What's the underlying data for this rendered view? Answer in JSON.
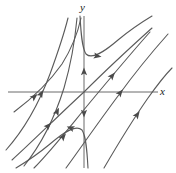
{
  "figure": {
    "kind": "slope-field-solution-curves",
    "title": "",
    "background_color": "#ffffff",
    "width": 176,
    "height": 173
  },
  "axes": {
    "x_label": "x",
    "y_label": "y",
    "origin": {
      "x": 84,
      "y": 92
    },
    "color": "#6b6b6b",
    "x_axis": {
      "x1": 8,
      "y1": 92,
      "x2": 158,
      "y2": 92
    },
    "y_axis": {
      "x1": 84,
      "y1": 16,
      "x2": 84,
      "y2": 168
    }
  },
  "chart_data": {
    "type": "line",
    "title": "",
    "xlabel": "x",
    "ylabel": "y",
    "grid": false,
    "legend": null,
    "curve_color": "#5a5a5a",
    "curve_width": 1.1,
    "curves": [
      {
        "name": "left-outer-1",
        "path": "M 6 150 C 22 132 38 106 50 74 C 58 52 64 34 68 18",
        "arrows": [
          {
            "x": 41,
            "y": 94,
            "angle": -60
          }
        ]
      },
      {
        "name": "left-outer-2",
        "path": "M 24 166 C 40 146 54 120 64 88 C 71 64 75 40 77 18",
        "arrows": [
          {
            "x": 57,
            "y": 112,
            "angle": -64
          }
        ]
      },
      {
        "name": "central-upper-branch",
        "path": "M 80 16 C 81 34 82 48 86 54 C 92 60 104 52 118 40 C 130 30 142 22 152 16",
        "arrows": [
          {
            "x": 97,
            "y": 56,
            "angle": 10
          }
        ]
      },
      {
        "name": "central-lower-branch",
        "path": "M 88 168 C 87 150 86 136 82 130 C 76 124 64 132 50 144 C 38 154 26 162 16 168",
        "arrows": [
          {
            "x": 71,
            "y": 128,
            "angle": -160
          }
        ]
      },
      {
        "name": "right-inner-1",
        "path": "M 34 168 C 52 150 72 124 92 100 C 112 76 132 52 150 32",
        "arrows": [
          {
            "x": 63,
            "y": 137,
            "angle": -50
          },
          {
            "x": 112,
            "y": 76,
            "angle": -50
          }
        ]
      },
      {
        "name": "through-origin-1",
        "path": "M 12 160 C 32 142 60 114 84 92 C 106 70 132 46 152 28",
        "arrows": [
          {
            "x": 48,
            "y": 126,
            "angle": -46
          }
        ]
      },
      {
        "name": "right-mid",
        "path": "M 66 168 C 82 146 100 120 118 96 C 134 74 152 52 168 34",
        "arrows": [
          {
            "x": 120,
            "y": 93,
            "angle": -52
          }
        ]
      },
      {
        "name": "right-outer",
        "path": "M 104 168 C 118 144 134 118 148 98 C 158 84 166 74 172 68",
        "arrows": [
          {
            "x": 137,
            "y": 115,
            "angle": -55
          }
        ]
      },
      {
        "name": "left-steep-upper",
        "path": "M 14 112 C 30 100 48 84 62 64 C 72 48 78 32 81 18",
        "arrows": [
          {
            "x": 34,
            "y": 97,
            "angle": -40
          }
        ]
      }
    ],
    "axis_arrows": [
      {
        "name": "y-axis-flow-up",
        "x": 84,
        "y": 72,
        "direction": "up"
      },
      {
        "name": "y-axis-flow-down",
        "x": 84,
        "y": 113,
        "direction": "down"
      }
    ]
  }
}
